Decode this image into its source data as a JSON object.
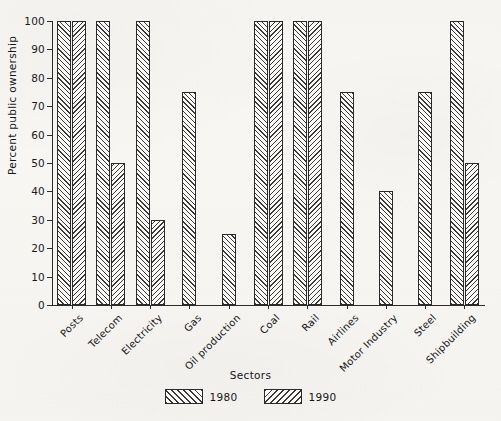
{
  "chart_data": {
    "type": "bar",
    "title": "",
    "xlabel": "Sectors",
    "ylabel": "Percent public ownership",
    "ylim": [
      0,
      100
    ],
    "ytick_step": 10,
    "yticks": [
      0,
      10,
      20,
      30,
      40,
      50,
      60,
      70,
      80,
      90,
      100
    ],
    "grid": false,
    "legend_position": "bottom-center",
    "categories": [
      "Posts",
      "Telecom",
      "Electricity",
      "Gas",
      "Oil production",
      "Coal",
      "Rail",
      "Airlines",
      "Motor Industry",
      "Steel",
      "Shipbuilding"
    ],
    "series": [
      {
        "name": "1980",
        "hatch": "forward-diagonal",
        "values": [
          100,
          100,
          100,
          75,
          25,
          100,
          100,
          75,
          40,
          75,
          100
        ]
      },
      {
        "name": "1990",
        "hatch": "backward-diagonal",
        "values": [
          100,
          50,
          30,
          null,
          null,
          100,
          100,
          null,
          null,
          null,
          50
        ]
      }
    ]
  },
  "legend": {
    "items": [
      {
        "label": "1980",
        "hatch": "h1980"
      },
      {
        "label": "1990",
        "hatch": "h1990"
      }
    ]
  },
  "colors": {
    "background": "#f7f6f3",
    "axis": "#2b2b2b",
    "hatch": "#3a3a3a",
    "bar_fill": "#fbfaf8",
    "text": "#141414"
  }
}
